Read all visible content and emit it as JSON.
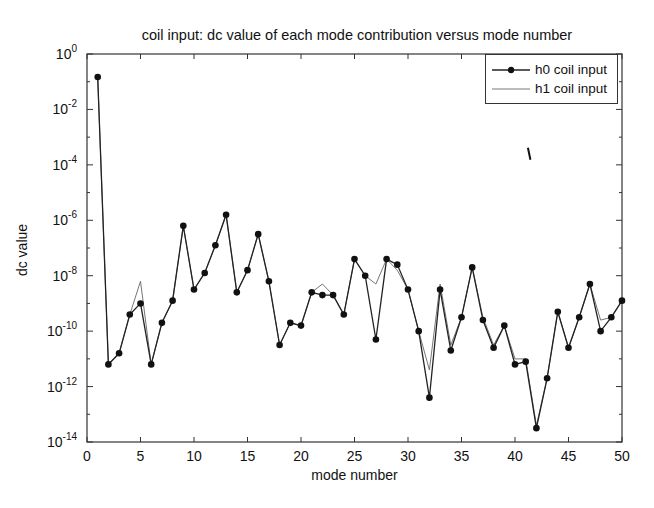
{
  "chart_data": {
    "type": "line",
    "title": "coil input:  dc value of each mode contribution versus mode number",
    "xlabel": "mode number",
    "ylabel": "dc value",
    "yscale": "log",
    "xlim": [
      0,
      50
    ],
    "ylim": [
      1e-14,
      1
    ],
    "xticks": [
      0,
      5,
      10,
      15,
      20,
      25,
      30,
      35,
      40,
      45,
      50
    ],
    "yticks_exponents": [
      0,
      -2,
      -4,
      -6,
      -8,
      -10,
      -12,
      -14
    ],
    "ytick_labels": [
      "10^0",
      "10^-2",
      "10^-4",
      "10^-6",
      "10^-8",
      "10^-10",
      "10^-12",
      "10^-14"
    ],
    "grid": false,
    "legend_position": "upper right",
    "x": [
      1,
      2,
      3,
      4,
      5,
      6,
      7,
      8,
      9,
      10,
      11,
      12,
      13,
      14,
      15,
      16,
      17,
      18,
      19,
      20,
      21,
      22,
      23,
      24,
      25,
      26,
      27,
      28,
      29,
      30,
      31,
      32,
      33,
      34,
      35,
      36,
      37,
      38,
      39,
      40,
      41,
      42,
      43,
      44,
      45,
      46,
      47,
      48,
      49,
      50
    ],
    "series": [
      {
        "name": "h0 coil input",
        "style": "line with filled circle markers",
        "log10_values": [
          -0.83,
          -11.2,
          -10.8,
          -9.4,
          -9.0,
          -11.2,
          -9.7,
          -8.9,
          -6.2,
          -8.5,
          -7.9,
          -6.9,
          -5.8,
          -8.6,
          -7.8,
          -6.5,
          -8.2,
          -10.5,
          -9.7,
          -9.8,
          -8.6,
          -8.7,
          -8.7,
          -9.4,
          -7.4,
          -8.0,
          -10.3,
          -7.4,
          -7.6,
          -8.5,
          -10.0,
          -12.4,
          -8.5,
          -10.7,
          -9.5,
          -7.7,
          -9.6,
          -10.6,
          -9.8,
          -11.2,
          -11.1,
          -13.5,
          -11.7,
          -9.3,
          -10.6,
          -9.5,
          -8.3,
          -10.0,
          -9.5,
          -8.9
        ]
      },
      {
        "name": "h1 coil input",
        "style": "thin line, no markers",
        "log10_values": [
          -0.83,
          -11.2,
          -10.8,
          -9.4,
          -8.2,
          -11.2,
          -9.7,
          -8.9,
          -6.2,
          -8.5,
          -7.9,
          -6.9,
          -5.8,
          -8.6,
          -7.8,
          -6.5,
          -8.2,
          -10.5,
          -9.7,
          -9.8,
          -8.6,
          -8.3,
          -8.7,
          -9.4,
          -7.4,
          -8.0,
          -8.3,
          -7.4,
          -7.8,
          -8.5,
          -10.0,
          -11.4,
          -8.3,
          -10.5,
          -9.5,
          -7.7,
          -9.5,
          -10.5,
          -9.8,
          -11.0,
          -11.0,
          -13.4,
          -11.7,
          -9.3,
          -10.6,
          -9.5,
          -8.3,
          -9.6,
          -9.5,
          -8.9
        ]
      }
    ],
    "annotations": [
      {
        "type": "stray-mark",
        "x": 41.3,
        "log10_y": -3.6
      }
    ]
  },
  "legend": {
    "items": [
      {
        "label": "h0 coil input"
      },
      {
        "label": "h1 coil input"
      }
    ]
  }
}
